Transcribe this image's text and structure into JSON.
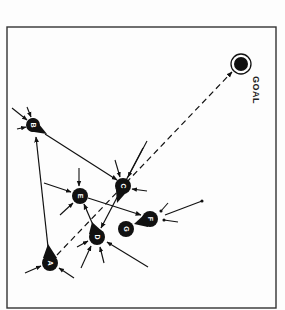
{
  "diagram": {
    "type": "goal-directed node network",
    "frame": {
      "x": 7,
      "y": 27,
      "width": 269,
      "height": 281,
      "stroke": "#333333"
    },
    "colors": {
      "ink": "#111111",
      "paper": "#fdfdfd",
      "label": "#ffffff"
    },
    "goal": {
      "id": "goal",
      "label": "GOAL",
      "x": 241,
      "y": 64,
      "outer_r": 10,
      "inner_r": 7
    },
    "nodes": [
      {
        "id": "A",
        "label": "A",
        "x": 50,
        "y": 263,
        "shape": "teardrop",
        "tail_angle": -95
      },
      {
        "id": "B",
        "label": "B",
        "x": 34,
        "y": 125,
        "shape": "teardrop",
        "tail_angle": 35
      },
      {
        "id": "C",
        "label": "C",
        "x": 123,
        "y": 186,
        "shape": "teardrop",
        "tail_angle": 110
      },
      {
        "id": "D",
        "label": "D",
        "x": 97,
        "y": 236,
        "shape": "teardrop",
        "tail_angle": -105
      },
      {
        "id": "E",
        "label": "E",
        "x": 80,
        "y": 196,
        "shape": "circle"
      },
      {
        "id": "F",
        "label": "F",
        "x": 150,
        "y": 219,
        "shape": "teardrop",
        "tail_angle": 165
      },
      {
        "id": "G",
        "label": "G",
        "x": 126,
        "y": 229,
        "shape": "circle"
      }
    ],
    "edges": [
      {
        "from": "A",
        "to": "B",
        "style": "solid",
        "arrow": true
      },
      {
        "from": "B",
        "to": "C",
        "style": "solid",
        "arrow": true
      },
      {
        "from": "A",
        "to": "goal",
        "style": "dashed",
        "arrow": true
      },
      {
        "from": "C",
        "to": "D",
        "style": "solid",
        "arrow": true
      },
      {
        "from": "D",
        "to": "E",
        "style": "solid",
        "arrow": true
      },
      {
        "from": "E",
        "to": "F",
        "style": "solid",
        "arrow": true
      },
      {
        "from": "F",
        "to": "G",
        "style": "tail-link",
        "arrow": false
      }
    ]
  }
}
